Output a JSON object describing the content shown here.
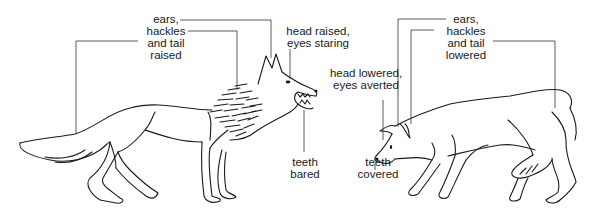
{
  "diagram": {
    "colors": {
      "line": "#1a1a1a",
      "background": "#ffffff"
    },
    "dominant_wolf": {
      "name": "dominant-wolf",
      "labels": {
        "ears_hackles_tail": [
          "ears,",
          "hackles",
          "and tail",
          "raised"
        ],
        "head_eyes": [
          "head raised,",
          "eyes staring"
        ],
        "teeth": [
          "teeth",
          "bared"
        ]
      }
    },
    "submissive_wolf": {
      "name": "submissive-wolf",
      "labels": {
        "ears_hackles_tail": [
          "ears,",
          "hackles",
          "and tail",
          "lowered"
        ],
        "head_eyes": [
          "head lowered,",
          "eyes averted"
        ],
        "teeth": [
          "teeth",
          "covered"
        ]
      }
    }
  }
}
